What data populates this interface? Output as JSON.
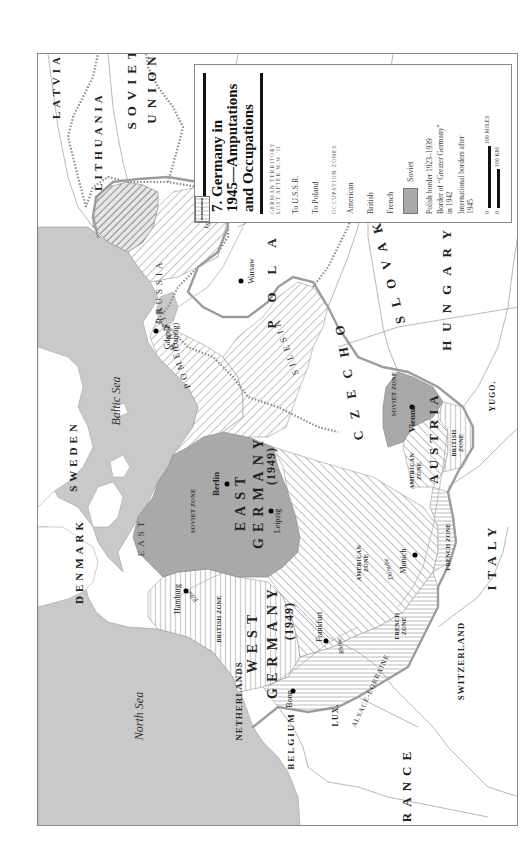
{
  "map": {
    "title": "7. Germany in 1945—Amputations and Occupations",
    "title_lines": [
      "7. Germany in",
      "1945—Amputations",
      "and Occupations"
    ],
    "orientation": "rotated 90° counter-clockwise",
    "legend": {
      "section_territory": "GERMAN TERRITORY LOST AFTER W.W. II",
      "section_territory_lines": [
        "GERMAN TERRITORY",
        "LOST AFTER W.W. II"
      ],
      "territory_items": [
        {
          "label": "To U.S.S.R.",
          "pattern": "dense-diagonal-hatch"
        },
        {
          "label": "To Poland",
          "pattern": "light-diagonal-hatch"
        }
      ],
      "section_zones": "OCCUPATION ZONES",
      "zone_items": [
        {
          "label": "American",
          "pattern": "diagonal-hatch"
        },
        {
          "label": "British",
          "pattern": "vertical-lines"
        },
        {
          "label": "French",
          "pattern": "horizontal-lines"
        },
        {
          "label": "Soviet",
          "pattern": "solid-gray"
        }
      ],
      "line_items": [
        {
          "label": "Polish border 1923–1939",
          "style": "dotted"
        },
        {
          "label": "Border of “Greater Germany” in 1942",
          "style": "dashed"
        },
        {
          "label": "International borders after 1945",
          "style": "thin-solid"
        }
      ],
      "scale": {
        "miles_zero": "0",
        "miles_label": "100 MILES",
        "km_zero": "0",
        "km_label": "100 KM"
      }
    },
    "colors": {
      "sea": "#c9c9c9",
      "land": "#ffffff",
      "soviet_zone": "#a9a9a9",
      "hatch": "#b9b9b9",
      "border": "#8c8c8c",
      "text": "#222222"
    },
    "labels": {
      "countries": {
        "latvia": "LATVIA",
        "lithuania": "LITHUANIA",
        "soviet": "SOVIET",
        "union": "UNION",
        "sweden": "SWEDEN",
        "denmark": "DENMARK",
        "netherlands": "NETHERLANDS",
        "belgium": "BELGIUM",
        "lux": "LUX.",
        "france": "FRANCE",
        "switzerland": "SWITZERLAND",
        "italy": "ITALY",
        "yugo": "YUGO.",
        "romania": "ROMANIA",
        "hungary": "HUNGARY",
        "czecho": "CZECHO",
        "slovakia": "SLOVAKIA",
        "poland": "POLAND",
        "austria": "AUSTRIA",
        "east": "EAST",
        "east_germany": "GERMANY",
        "east_germany_year": "(1949)",
        "west": "WEST",
        "west_germany": "GERMANY",
        "west_germany_year": "(1949)"
      },
      "regions": {
        "east_prussia_1": "EAST",
        "east_prussia_2": "PRUSSIA",
        "pomerania": "POMERANIA",
        "silesia": "SILESIA",
        "alsace_lorraine": "ALSACE-LORRAINE"
      },
      "seas": {
        "baltic": "Baltic Sea",
        "north": "North Sea"
      },
      "rivers": {
        "vistula": "Vistula",
        "elbe": "Elbe",
        "rhine": "Rhine",
        "danube": "Danube"
      },
      "cities": {
        "warsaw": "Warsaw",
        "gdansk": "Gdansk",
        "danzig": "(Danzig)",
        "berlin": "Berlin",
        "leipzig": "Leipzig",
        "hamburg": "Hamburg",
        "frankfurt": "Frankfurt",
        "bonn": "Bonn",
        "munich": "Munich",
        "vienna": "Vienna"
      },
      "zones": {
        "soviet_de": [
          "SOVIET ZONE"
        ],
        "british_de": [
          "BRITISH ZONE"
        ],
        "american_de": [
          "AMERICAN",
          "ZONE"
        ],
        "french_de": [
          "FRENCH",
          "ZONE"
        ],
        "soviet_at": [
          "SOVIET ZONE"
        ],
        "american_at": [
          "AMERICAN",
          "ZONE"
        ],
        "british_at": [
          "BRITISH",
          "ZONE"
        ],
        "french_at": [
          "FRENCH ZONE"
        ]
      }
    }
  }
}
